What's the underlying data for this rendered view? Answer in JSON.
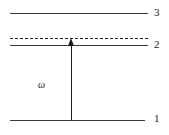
{
  "diagram": {
    "type": "energy-level-diagram",
    "background_color": "#ffffff",
    "line_color": "#3a3a3a",
    "dashed_line_color": "#1a1a1a",
    "arrow_color": "#1a1a1a",
    "text_color": "#1a1a1a",
    "levels": [
      {
        "id": "level-3",
        "label": "3",
        "style": "solid",
        "y": 13,
        "x_start": 10,
        "x_end": 148,
        "label_x": 154,
        "label_y": 7
      },
      {
        "id": "virtual-level",
        "label": "",
        "style": "dashed",
        "y": 38,
        "x_start": 10,
        "x_end": 148,
        "label_x": 0,
        "label_y": 0
      },
      {
        "id": "level-2",
        "label": "2",
        "style": "solid",
        "y": 45,
        "x_start": 10,
        "x_end": 148,
        "label_x": 154,
        "label_y": 39
      },
      {
        "id": "level-1",
        "label": "1",
        "style": "solid",
        "y": 120,
        "x_start": 10,
        "x_end": 145,
        "label_x": 154,
        "label_y": 113
      }
    ],
    "transitions": [
      {
        "id": "omega-transition",
        "label": "ω",
        "direction": "up",
        "x": 71,
        "y_start": 120,
        "y_end": 39,
        "label_x": 38,
        "label_y": 80
      }
    ]
  }
}
